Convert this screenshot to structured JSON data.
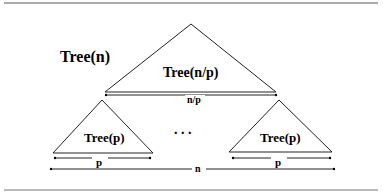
{
  "diagram": {
    "root_label": "Tree(n)",
    "top_tree_label": "Tree(n/p)",
    "top_width_label": "n/p",
    "left_tree_label": "Tree(p)",
    "right_tree_label": "Tree(p)",
    "left_width_label": "p",
    "right_width_label": "p",
    "ellipsis": ". . .",
    "total_width_label": "n"
  }
}
